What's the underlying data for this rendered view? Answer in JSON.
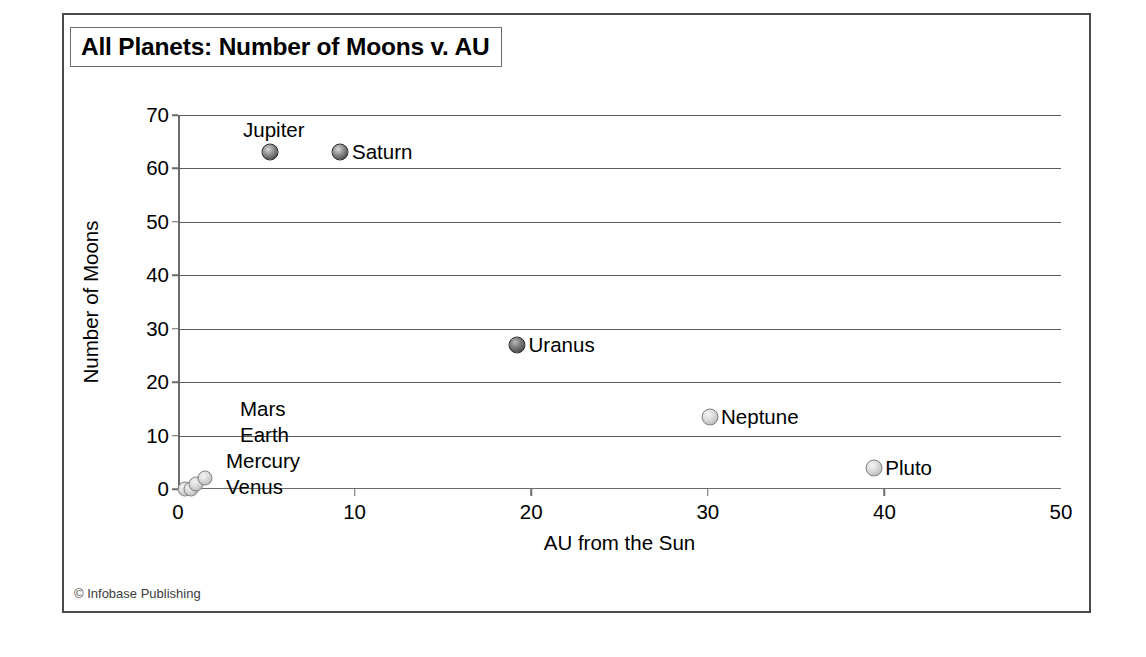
{
  "figure": {
    "title": "All Planets: Number of Moons v. AU",
    "credit": "© Infobase Publishing"
  },
  "chart_data": {
    "type": "scatter",
    "title": "All Planets: Number of Moons v. AU",
    "xlabel": "AU from the Sun",
    "ylabel": "Number of Moons",
    "xlim": [
      0,
      50
    ],
    "ylim": [
      0,
      70
    ],
    "xticks": [
      "0",
      "10",
      "20",
      "30",
      "40",
      "50"
    ],
    "yticks": [
      "0",
      "10",
      "20",
      "30",
      "40",
      "50",
      "60",
      "70"
    ],
    "grid": "horizontal",
    "legend": "none",
    "points": [
      {
        "label": "Mercury",
        "x": 0.39,
        "y": 0,
        "shade": "light",
        "size": 15,
        "label_pos": "stack"
      },
      {
        "label": "Venus",
        "x": 0.72,
        "y": 0,
        "shade": "light",
        "size": 15,
        "label_pos": "stack"
      },
      {
        "label": "Earth",
        "x": 1.0,
        "y": 1,
        "shade": "light",
        "size": 15,
        "label_pos": "stack"
      },
      {
        "label": "Mars",
        "x": 1.52,
        "y": 2,
        "shade": "light",
        "size": 15,
        "label_pos": "stack"
      },
      {
        "label": "Jupiter",
        "x": 5.2,
        "y": 63,
        "shade": "dark",
        "size": 17,
        "label_pos": "above"
      },
      {
        "label": "Saturn",
        "x": 9.2,
        "y": 63,
        "shade": "dark",
        "size": 17,
        "label_pos": "right"
      },
      {
        "label": "Uranus",
        "x": 19.2,
        "y": 27,
        "shade": "mid",
        "size": 17,
        "label_pos": "right"
      },
      {
        "label": "Neptune",
        "x": 30.1,
        "y": 13.5,
        "shade": "light",
        "size": 17,
        "label_pos": "right"
      },
      {
        "label": "Pluto",
        "x": 39.4,
        "y": 4,
        "shade": "light",
        "size": 17,
        "label_pos": "right"
      }
    ],
    "stacked_labels": [
      "Mars",
      "Earth",
      "Mercury",
      "Venus"
    ]
  }
}
